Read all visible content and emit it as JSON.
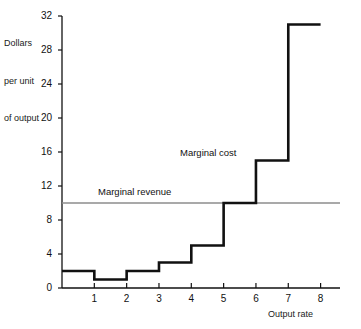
{
  "chart_data": {
    "type": "line",
    "title": "",
    "xlabel": "Output rate",
    "ylabel": "Dollars per unit of output",
    "ylabel_lines": [
      "Dollars",
      "per unit",
      "of output"
    ],
    "xlim": [
      0,
      8.6
    ],
    "ylim": [
      0,
      32
    ],
    "grid": false,
    "legend_position": "inline-annotations",
    "y_ticks": [
      0,
      4,
      8,
      12,
      16,
      20,
      24,
      28,
      32
    ],
    "y_tick_labels": [
      "0",
      "4",
      "8",
      "12",
      "16",
      "20",
      "24",
      "28",
      "32"
    ],
    "x_ticks": [
      1,
      2,
      3,
      4,
      5,
      6,
      7,
      8
    ],
    "x_tick_labels": [
      "1",
      "2",
      "3",
      "4",
      "5",
      "6",
      "7",
      "8"
    ],
    "series": [
      {
        "name": "Marginal cost",
        "type": "step",
        "color": "#111111",
        "line_width": 2.6,
        "categories": [
          "0-1",
          "1-2",
          "2-3",
          "3-4",
          "4-5",
          "5-6",
          "6-7",
          "7-8"
        ],
        "x_edges": [
          0,
          1,
          2,
          3,
          4,
          5,
          6,
          7,
          8
        ],
        "values": [
          2,
          1,
          2,
          3,
          5,
          10,
          15,
          31
        ]
      },
      {
        "name": "Marginal revenue",
        "type": "hline",
        "color": "#8c8c8c",
        "line_width": 1.6,
        "value": 10,
        "x_from": 0,
        "x_to": 8.6
      }
    ],
    "annotations": [
      {
        "text": "Marginal revenue",
        "x": 1.2,
        "y": 11.6
      },
      {
        "text": "Marginal cost",
        "x": 3.9,
        "y": 16.6
      }
    ]
  },
  "axis": {
    "y_title_line1": "Dollars",
    "y_title_line2": "per unit",
    "y_title_line3": "of output",
    "x_title": "Output rate"
  },
  "colors": {
    "marginal_cost": "#111111",
    "marginal_revenue": "#8c8c8c",
    "axis": "#111111",
    "background": "#ffffff"
  }
}
